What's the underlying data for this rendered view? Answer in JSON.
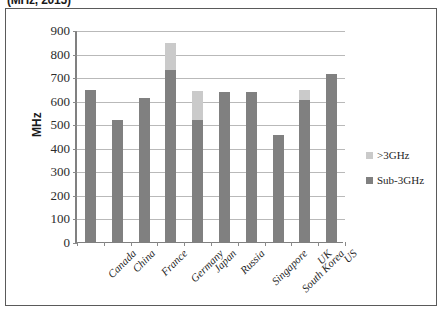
{
  "chart_data": {
    "type": "bar",
    "title": "(MHz, 2015)",
    "xlabel": "",
    "ylabel": "MHz",
    "ylim": [
      0,
      900
    ],
    "ytick_step": 100,
    "grid": true,
    "stacked": true,
    "legend_position": "right",
    "categories": [
      "Canada",
      "China",
      "France",
      "Germany",
      "Japan",
      "Russia",
      "Singapore",
      "South Korea",
      "UK",
      "US"
    ],
    "series": [
      {
        "name": "Sub-3GHz",
        "color": "#808080",
        "values": [
          645,
          520,
          610,
          730,
          520,
          637,
          637,
          455,
          605,
          713
        ]
      },
      {
        "name": ">3GHz",
        "color": "#cacaca",
        "values": [
          0,
          0,
          0,
          115,
          120,
          0,
          0,
          0,
          40,
          0
        ]
      }
    ],
    "totals": [
      645,
      520,
      610,
      845,
      640,
      637,
      637,
      455,
      645,
      713
    ],
    "ytick_labels": [
      "900",
      "800",
      "700",
      "600",
      "500",
      "400",
      "300",
      "200",
      "100",
      "0"
    ]
  },
  "legend": {
    "items": [
      {
        "label": ">3GHz",
        "color": "#cacaca"
      },
      {
        "label": "Sub-3GHz",
        "color": "#808080"
      }
    ]
  }
}
